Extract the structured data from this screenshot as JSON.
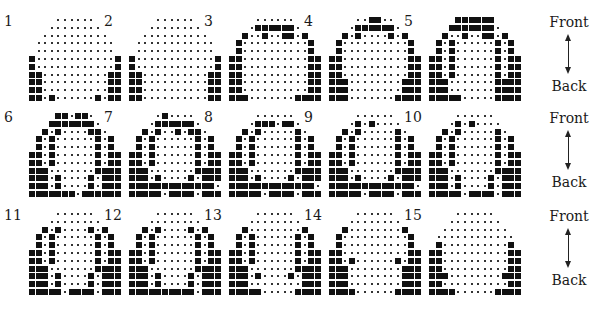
{
  "figure": {
    "legend": {
      "front": "Front",
      "back": "Back"
    },
    "panels": [
      {
        "label": "1",
        "rows": [
          "    ......    ",
          "   ........   ",
          "  ..........  ",
          " ............ ",
          " ............ ",
          "#............#",
          "#............#",
          "##..........##",
          "##..........##",
          "##..........##",
          "##.#......#.##"
        ]
      },
      {
        "label": "2",
        "rows": [
          "    ......    ",
          "   ........   ",
          "  ..........  ",
          " ............ ",
          " ............ ",
          "#............#",
          "#............#",
          "##..........##",
          "##..........##",
          "##..........##",
          "##..........##"
        ]
      },
      {
        "label": "3",
        "rows": [
          "    ......    ",
          "   .######.   ",
          "  #..#..##.#  ",
          " #..........# ",
          " #..........# ",
          "##..........##",
          "##..........##",
          "##..........##",
          "##..........##",
          "##..........##",
          "###.......####"
        ]
      },
      {
        "label": "4",
        "rows": [
          "    ..##..    ",
          "   .######.   ",
          "  #.#....#.#  ",
          " #..........# ",
          " #..........# ",
          "##..........##",
          "##..........##",
          "##..........##",
          "###........###",
          "###........###",
          "###.......####"
        ]
      },
      {
        "label": "5",
        "rows": [
          "    ######    ",
          "   #######.   ",
          "  #..#..##.#  ",
          " #.#......#.# ",
          " #.#......#.# ",
          "##.#......#.##",
          "##.#......#.##",
          "##.#......#.##",
          "###.......####",
          "###.......####",
          "#####.....####"
        ]
      },
      {
        "label": "6",
        "rows": [
          "    ##.##.    ",
          "   #######.   ",
          "  #.#....##.  ",
          " #.#......#.# ",
          " #.#......#.# ",
          "##.#......#.##",
          "##.#......#.##",
          "###.......####",
          "###.#....#.###",
          "###.#....#.###",
          "#######.######"
        ]
      },
      {
        "label": "7",
        "rows": [
          "    .#....    ",
          "   .######.   ",
          "  #.#..#.##.  ",
          " #.#......#.# ",
          " #.#......#.# ",
          "##.#......#.##",
          "##.#......#.##",
          "###.......####",
          "###.#....#.###",
          "#############.",
          "#####.####.###"
        ]
      },
      {
        "label": "8",
        "rows": [
          "    ......    ",
          "   .###.##.   ",
          "  #.#.....#.  ",
          " #.#......#.# ",
          " #.#......#.# ",
          "##.#......#.##",
          "##.#......#.##",
          "###.......####",
          "###.#....#.###",
          "#############.",
          "#####.####.###"
        ]
      },
      {
        "label": "9",
        "rows": [
          "    ......    ",
          "   .#.#....   ",
          "  #.#.....#.  ",
          " #.#......#.# ",
          " #.#......#.# ",
          "##.#......#.##",
          "##.#......#.##",
          "###.......####",
          "###.#....#.###",
          "#############.",
          "#####.####.###"
        ]
      },
      {
        "label": "10",
        "rows": [
          "    ......    ",
          "   .#.#....   ",
          "  #.#.....#.  ",
          " #.#......#.# ",
          " #.#......#.# ",
          "##.#......#.##",
          "##.#......#.##",
          "###.......####",
          "###.#....#.###",
          "###.#....#.###",
          "#####.####.###"
        ]
      },
      {
        "label": "11",
        "rows": [
          "    ......    ",
          "   ........   ",
          "  #.#....#.#  ",
          " #.#......#.# ",
          " #.#......#.# ",
          "##.#......#.##",
          "##.#......#.##",
          "###.......####",
          "###.#....#.###",
          "###.#....#.###",
          "#####.####.###"
        ]
      },
      {
        "label": "12",
        "rows": [
          "    ......    ",
          "   ........   ",
          "  #.#....#.#  ",
          " #.#......#.# ",
          " #.#......#.# ",
          "##.#......#.##",
          "##.#......#.##",
          "###.......####",
          "###.#....#.###",
          "###.#....#.###",
          "##########.###"
        ]
      },
      {
        "label": "13",
        "rows": [
          "    ......    ",
          "   ........   ",
          "  #........#  ",
          " #.#......#.# ",
          " #.#......#.# ",
          "##.#......#.##",
          "##.#......#.##",
          "###.......####",
          "###.#....#.###",
          "###........###",
          "#####.....####"
        ]
      },
      {
        "label": "14",
        "rows": [
          "    ......    ",
          "   ........   ",
          "  #........#  ",
          " #..........# ",
          " #..........# ",
          "##..........##",
          "##.#......#.##",
          "###........###",
          "###........###",
          "###........###",
          "####......####"
        ]
      },
      {
        "label": "15",
        "rows": [
          "    ......    ",
          "   ........   ",
          "  ..........  ",
          " ............ ",
          " #..........# ",
          "##..........##",
          "##..........##",
          "##..........##",
          "###........###",
          "##..........##",
          "####......####"
        ]
      }
    ]
  }
}
